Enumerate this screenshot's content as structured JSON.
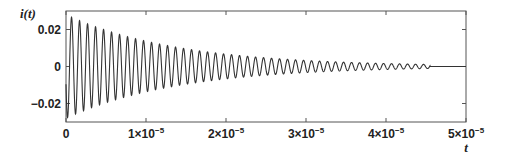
{
  "chart_data": {
    "type": "line",
    "title": "",
    "xlabel": "t",
    "ylabel": "i(t)",
    "xlim": [
      0,
      5e-05
    ],
    "ylim": [
      -0.03,
      0.03
    ],
    "grid": false,
    "legend": null,
    "x_ticks": [
      {
        "value": 0,
        "label": "0"
      },
      {
        "value": 1e-05,
        "label": "1×10",
        "exp": "−5"
      },
      {
        "value": 2e-05,
        "label": "2×10",
        "exp": "−5"
      },
      {
        "value": 3e-05,
        "label": "3×10",
        "exp": "−5"
      },
      {
        "value": 4e-05,
        "label": "4×10",
        "exp": "−5"
      },
      {
        "value": 5e-05,
        "label": "5×10",
        "exp": "−5"
      }
    ],
    "y_ticks": [
      {
        "value": 0.02,
        "label": "0.02"
      },
      {
        "value": 0,
        "label": "0"
      },
      {
        "value": -0.02,
        "label": "−0.02"
      }
    ],
    "series": [
      {
        "name": "i(t)",
        "description": "Damped sinusoidal current, ~1 MHz oscillation, decaying envelope, oscillation ceases near t≈4.55e-5 then flat at 0",
        "model": {
          "initial_amplitude": 0.028,
          "frequency_hz": 1000000.0,
          "decay_time_constant_s": 1.4e-05,
          "stop_time_s": 4.55e-05
        },
        "envelope_samples": {
          "t": [
            0,
            1e-05,
            2e-05,
            3e-05,
            4e-05,
            4.55e-05,
            5e-05
          ],
          "amplitude": [
            0.027,
            0.015,
            0.007,
            0.003,
            0.0015,
            0.001,
            0
          ]
        }
      }
    ],
    "color": "#333333"
  }
}
